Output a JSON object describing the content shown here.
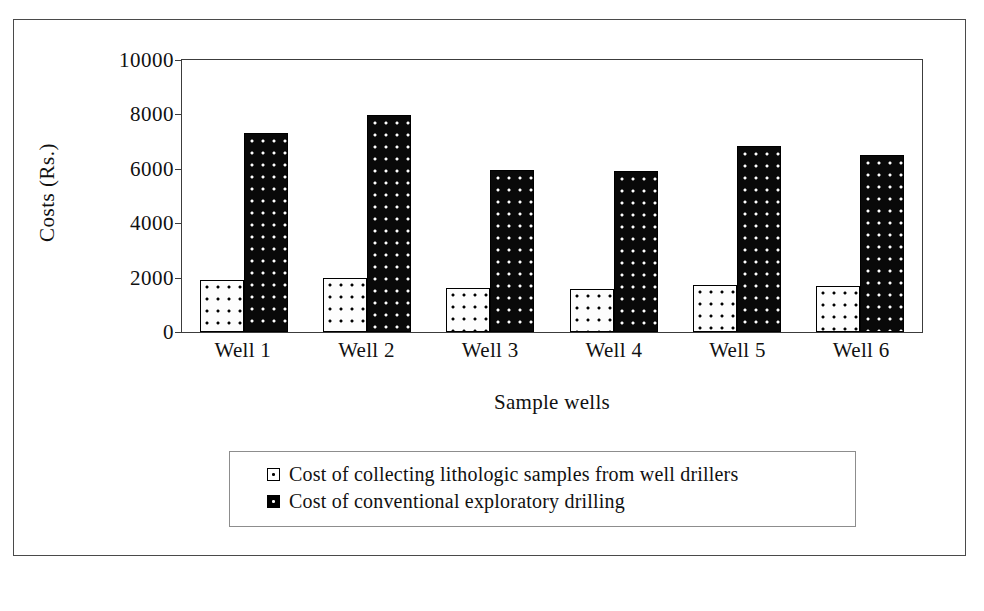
{
  "chart_data": {
    "type": "bar",
    "title": "",
    "xlabel": "Sample wells",
    "ylabel": "Costs (Rs.)",
    "categories": [
      "Well 1",
      "Well 2",
      "Well 3",
      "Well 4",
      "Well 5",
      "Well 6"
    ],
    "series": [
      {
        "name": "Cost of collecting lithologic samples from well drillers",
        "values": [
          1900,
          2000,
          1620,
          1580,
          1730,
          1680
        ]
      },
      {
        "name": "Cost of conventional exploratory drilling",
        "values": [
          7320,
          7980,
          5950,
          5930,
          6840,
          6520
        ]
      }
    ],
    "ylim": [
      0,
      10000
    ],
    "ytick_labels": [
      "0",
      "2000",
      "4000",
      "6000",
      "8000",
      "10000"
    ],
    "yticks": [
      0,
      2000,
      4000,
      6000,
      8000,
      10000
    ],
    "grid": false,
    "legend_position": "bottom"
  },
  "legend": {
    "entries": [
      {
        "marker": "dotted-white-square-icon",
        "label": "Cost of collecting lithologic samples from well drillers"
      },
      {
        "marker": "dotted-black-square-icon",
        "label": "Cost of conventional exploratory drilling"
      }
    ]
  }
}
